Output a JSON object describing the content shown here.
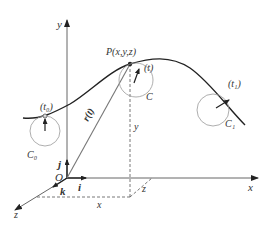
{
  "diagram": {
    "type": "space-curve-vector-diagram",
    "axes": {
      "x_label": "x",
      "y_label": "y",
      "z_label": "z",
      "origin_label": "O"
    },
    "unit_vectors": {
      "i": "i",
      "j": "j",
      "k": "k"
    },
    "point": {
      "label": "P(x,y,z)"
    },
    "position_vector": {
      "label": "r(t)"
    },
    "parameters": {
      "start": "(t₀)",
      "current": "(t)",
      "end": "(t₁)"
    },
    "circles": {
      "c0": "C₀",
      "c": "C",
      "c1": "C₁"
    },
    "projections": {
      "x": "x",
      "y": "y",
      "z": "z"
    },
    "colors": {
      "line": "#444444",
      "light_line": "#888888",
      "background": "#ffffff"
    }
  }
}
